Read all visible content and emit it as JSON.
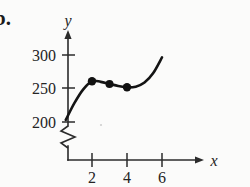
{
  "figure": {
    "problem_label": "b.",
    "background_color": "#fbfbfa",
    "curve_color": "#141414",
    "axis_color": "#2b2b2b",
    "point_color": "#111111"
  },
  "chart_data": {
    "type": "line",
    "title": "",
    "subtitle": "",
    "xlabel": "x",
    "ylabel": "y",
    "xlim": [
      0,
      7
    ],
    "ylim": [
      190,
      305
    ],
    "grid": false,
    "legend": null,
    "axis_break": {
      "axis": "y",
      "symbol": "zigzag",
      "note": "y-axis broken below 200"
    },
    "xticks": [
      2,
      4,
      6
    ],
    "xtick_labels": [
      "2",
      "4",
      "6"
    ],
    "yticks": [
      200,
      250,
      300
    ],
    "ytick_labels": [
      "200",
      "250",
      "300"
    ],
    "series": [
      {
        "name": "curve",
        "type": "line",
        "x": [
          0.5,
          1.0,
          1.5,
          2.0,
          2.5,
          3.0,
          3.5,
          4.0,
          4.5,
          5.0,
          5.5,
          6.0
        ],
        "y": [
          203,
          228,
          248,
          260,
          259,
          256,
          253,
          251,
          252,
          258,
          272,
          295
        ]
      },
      {
        "name": "marked-points",
        "type": "scatter",
        "x": [
          2,
          3,
          4
        ],
        "y": [
          260,
          256,
          251
        ]
      }
    ]
  }
}
